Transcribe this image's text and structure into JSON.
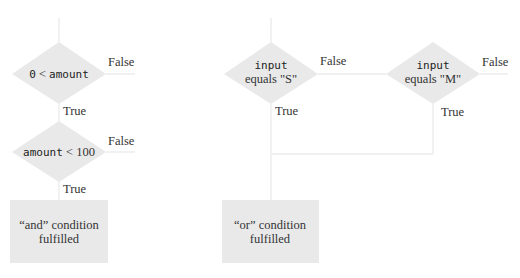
{
  "and_flow": {
    "decision1": {
      "code": "0",
      "op": " < ",
      "code2": "amount",
      "false_label": "False",
      "true_label": "True"
    },
    "decision2": {
      "code": "amount",
      "op": " < ",
      "code2": "100",
      "false_label": "False",
      "true_label": "True"
    },
    "result": {
      "line1": "“and” condition",
      "line2": "fulfilled"
    }
  },
  "or_flow": {
    "decision1": {
      "code": "input",
      "text": "equals \"S\"",
      "false_label": "False",
      "true_label": "True"
    },
    "decision2": {
      "code": "input",
      "text": "equals \"M\"",
      "false_label": "False",
      "true_label": "True"
    },
    "result": {
      "line1": "“or” condition",
      "line2": "fulfilled"
    }
  }
}
